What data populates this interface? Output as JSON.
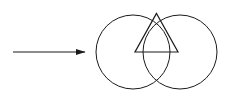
{
  "figure": {
    "canvas": {
      "width": 231,
      "height": 105,
      "background": "#ffffff"
    },
    "stroke_color": "#1a1a1a",
    "stroke_width": 1,
    "arrow": {
      "name": "implication-arrow",
      "x1": 13,
      "y1": 52,
      "x2": 85,
      "y2": 52,
      "head_length": 9,
      "head_half_width": 3.2,
      "label": ""
    },
    "circles": [
      {
        "name": "left-circle",
        "cx": 133,
        "cy": 52,
        "r": 37,
        "label": ""
      },
      {
        "name": "right-circle",
        "cx": 180,
        "cy": 52,
        "r": 37,
        "label": ""
      }
    ],
    "intersection_points": [
      {
        "name": "top-intersection",
        "x": 156.5,
        "y": 13.4
      },
      {
        "name": "bottom-intersection",
        "x": 156.5,
        "y": 90.6
      }
    ],
    "triangle": {
      "name": "inscribed-triangle",
      "apex": {
        "x": 156.5,
        "y": 13.4
      },
      "base_left": {
        "x": 135,
        "y": 52
      },
      "base_right": {
        "x": 178,
        "y": 52
      },
      "points": "156.5,13.4 135,52 178,52"
    },
    "base_segment": {
      "name": "triangle-base-segment",
      "x1": 135,
      "y1": 52,
      "x2": 178,
      "y2": 52
    }
  }
}
